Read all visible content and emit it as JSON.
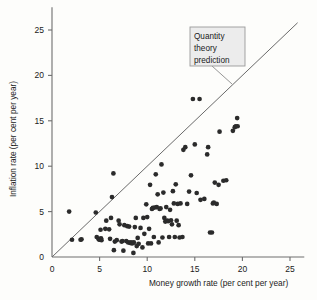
{
  "chart_data": {
    "type": "scatter",
    "title": "",
    "xlabel": "Money growth rate (per cent per year)",
    "ylabel": "Inflation rate (per cent per year)",
    "xlim": [
      0,
      26.5
    ],
    "ylim": [
      0,
      27.5
    ],
    "xticks": [
      0,
      5,
      10,
      15,
      20,
      25
    ],
    "yticks": [
      0,
      5,
      10,
      15,
      20,
      25
    ],
    "xtick_labels": [
      "0",
      "5",
      "10",
      "15",
      "20",
      "25"
    ],
    "ytick_labels": [
      "0",
      "5",
      "10",
      "15",
      "20",
      "25"
    ],
    "grid": false,
    "legend": "none",
    "annotations": [
      {
        "name": "quantity-theory-callout",
        "text_lines": [
          "Quantity",
          "theory",
          "prediction"
        ],
        "text": "Quantity theory prediction",
        "points_to": "45-degree-line"
      }
    ],
    "reference_line": {
      "name": "quantity-theory-prediction",
      "description": "45 degree line, inflation equals money growth",
      "slope": 1,
      "intercept": 0,
      "x_from": 0,
      "x_to": 25.8
    },
    "points": [
      [
        1.8,
        5.0
      ],
      [
        2.1,
        1.9
      ],
      [
        3.0,
        1.9
      ],
      [
        3.1,
        1.95
      ],
      [
        4.6,
        4.9
      ],
      [
        4.7,
        2.2
      ],
      [
        4.9,
        1.95
      ],
      [
        5.0,
        1.9
      ],
      [
        5.05,
        2.0
      ],
      [
        5.1,
        3.0
      ],
      [
        5.15,
        2.05
      ],
      [
        5.2,
        1.85
      ],
      [
        5.6,
        3.1
      ],
      [
        5.7,
        4.0
      ],
      [
        6.0,
        3.05
      ],
      [
        6.1,
        2.0
      ],
      [
        6.2,
        4.3
      ],
      [
        6.3,
        6.6
      ],
      [
        6.45,
        9.2
      ],
      [
        6.5,
        0.75
      ],
      [
        6.6,
        1.7
      ],
      [
        6.8,
        1.85
      ],
      [
        7.0,
        4.0
      ],
      [
        7.1,
        3.6
      ],
      [
        7.3,
        1.7
      ],
      [
        7.4,
        1.75
      ],
      [
        7.5,
        0.7
      ],
      [
        7.6,
        3.5
      ],
      [
        7.8,
        1.75
      ],
      [
        7.9,
        3.4
      ],
      [
        8.0,
        1.6
      ],
      [
        8.1,
        3.35
      ],
      [
        8.2,
        1.55
      ],
      [
        8.3,
        1.6
      ],
      [
        8.4,
        1.5
      ],
      [
        8.5,
        1.55
      ],
      [
        8.55,
        0.45
      ],
      [
        8.6,
        1.6
      ],
      [
        8.7,
        3.3
      ],
      [
        8.8,
        4.3
      ],
      [
        8.9,
        1.2
      ],
      [
        9.0,
        2.1
      ],
      [
        9.1,
        1.45
      ],
      [
        9.3,
        3.2
      ],
      [
        9.5,
        1.05
      ],
      [
        9.6,
        4.3
      ],
      [
        9.7,
        2.55
      ],
      [
        9.9,
        5.8
      ],
      [
        10.0,
        4.4
      ],
      [
        10.1,
        1.5
      ],
      [
        10.2,
        3.1
      ],
      [
        10.3,
        7.95
      ],
      [
        10.4,
        1.5
      ],
      [
        10.5,
        5.3
      ],
      [
        10.6,
        5.4
      ],
      [
        10.7,
        2.2
      ],
      [
        10.8,
        5.45
      ],
      [
        10.9,
        9.1
      ],
      [
        11.0,
        5.5
      ],
      [
        11.1,
        6.9
      ],
      [
        11.2,
        1.6
      ],
      [
        11.3,
        5.3
      ],
      [
        11.4,
        5.35
      ],
      [
        11.5,
        10.2
      ],
      [
        11.6,
        2.15
      ],
      [
        11.7,
        7.1
      ],
      [
        11.8,
        4.3
      ],
      [
        11.9,
        3.9
      ],
      [
        12.0,
        5.5
      ],
      [
        12.1,
        4.0
      ],
      [
        12.2,
        3.95
      ],
      [
        12.3,
        2.2
      ],
      [
        12.4,
        5.2
      ],
      [
        12.5,
        4.05
      ],
      [
        12.6,
        3.6
      ],
      [
        12.7,
        7.25
      ],
      [
        12.8,
        5.9
      ],
      [
        12.9,
        2.2
      ],
      [
        13.0,
        8.0
      ],
      [
        13.1,
        4.0
      ],
      [
        13.2,
        5.85
      ],
      [
        13.3,
        3.5
      ],
      [
        13.4,
        2.15
      ],
      [
        13.5,
        5.9
      ],
      [
        13.7,
        2.2
      ],
      [
        13.8,
        11.8
      ],
      [
        14.0,
        12.1
      ],
      [
        14.2,
        5.85
      ],
      [
        14.4,
        7.2
      ],
      [
        14.6,
        9.0
      ],
      [
        14.8,
        17.4
      ],
      [
        15.0,
        12.4
      ],
      [
        15.2,
        7.05
      ],
      [
        15.5,
        17.4
      ],
      [
        15.6,
        6.3
      ],
      [
        16.0,
        6.4
      ],
      [
        16.3,
        11.3
      ],
      [
        16.4,
        12.1
      ],
      [
        16.6,
        2.7
      ],
      [
        16.8,
        2.7
      ],
      [
        16.9,
        5.9
      ],
      [
        17.0,
        6.0
      ],
      [
        17.1,
        8.2
      ],
      [
        17.3,
        5.85
      ],
      [
        17.5,
        7.95
      ],
      [
        17.6,
        13.8
      ],
      [
        18.0,
        8.4
      ],
      [
        18.3,
        8.45
      ],
      [
        19.0,
        13.9
      ],
      [
        19.2,
        14.3
      ],
      [
        19.3,
        14.4
      ],
      [
        19.45,
        15.3
      ],
      [
        19.5,
        14.4
      ]
    ]
  },
  "axes": {
    "x_label": "Money growth rate (per cent per year)",
    "y_label": "Inflation rate (per cent per year)"
  },
  "callout": {
    "line1": "Quantity",
    "line2": "theory",
    "line3": "prediction"
  }
}
